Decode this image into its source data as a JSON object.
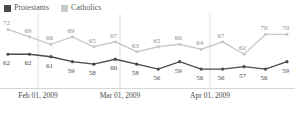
{
  "legend": {
    "position": "top-left",
    "items": [
      {
        "label": "Protestants",
        "color": "#4a4a4a",
        "icon": "square-swatch"
      },
      {
        "label": "Catholics",
        "color": "#c9c9c9",
        "icon": "square-swatch"
      }
    ]
  },
  "axis": {
    "ticks": [
      {
        "label": "Feb 01, 2009",
        "x": 38
      },
      {
        "label": "Mar 01, 2009",
        "x": 120
      },
      {
        "label": "Apr 01, 2009",
        "x": 210
      }
    ],
    "baseline_color": "#d6d6d6",
    "gridline_color": "#dcdcdc"
  },
  "chart_data": {
    "type": "line",
    "title": "",
    "xlabel": "",
    "ylabel": "",
    "ylim": [
      50,
      75
    ],
    "grid": true,
    "legend_position": "top-left",
    "x": [
      0,
      1,
      2,
      3,
      4,
      5,
      6,
      7,
      8,
      9,
      10,
      11,
      12,
      13
    ],
    "tick_labels": [
      "Feb 01, 2009",
      "Mar 01, 2009",
      "Apr 01, 2009"
    ],
    "series": [
      {
        "name": "Catholics",
        "color": "#c9c9c9",
        "values": [
          72,
          69,
          66,
          69,
          65,
          67,
          63,
          65,
          66,
          64,
          67,
          62,
          70,
          70
        ]
      },
      {
        "name": "Protestants",
        "color": "#4a4a4a",
        "values": [
          62,
          62,
          61,
          59,
          58,
          60,
          58,
          56,
          59,
          56,
          56,
          57,
          56,
          59
        ]
      }
    ]
  }
}
